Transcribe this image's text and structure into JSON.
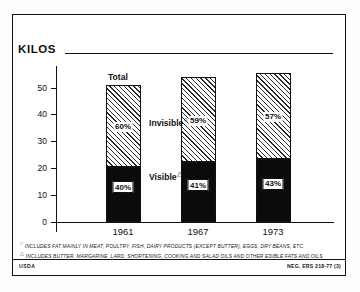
{
  "figure": {
    "unit_title": "KILOS",
    "agency": "USDA",
    "negative_number": "NEG. ERS 218-77 (3)",
    "footnotes": [
      {
        "marker": "○",
        "text": "INCLUDES FAT MAINLY IN MEAT, POULTRY, FISH, DAIRY PRODUCTS (EXCEPT BUTTER), EGGS, DRY BEANS, ETC."
      },
      {
        "marker": "△",
        "text": "INCLUDES BUTTER, MARGARINE, LARD, SHORTENING, COOKING AND SALAD OILS AND OTHER EDIBLE FATS AND OILS"
      }
    ],
    "annotations": {
      "total_label": "Total",
      "invisible_label": "Invisible",
      "invisible_marker": "○",
      "visible_label": "Visible",
      "visible_marker": "△"
    },
    "colors": {
      "visible_fill": "#0b0b0b",
      "invisible_fill": "#ffffff",
      "hatch": "#2a2a2a",
      "frame": "#111111",
      "background": "#ffffff"
    }
  },
  "chart_data": {
    "type": "bar",
    "title": "KILOS",
    "subtitle": "",
    "xlabel": "",
    "ylabel": "KILOS",
    "stacked": true,
    "grid": false,
    "legend_position": "in-plot",
    "categories": [
      "1961",
      "1967",
      "1973"
    ],
    "yticks": [
      0,
      10,
      20,
      30,
      40,
      50
    ],
    "ylim": [
      0,
      58
    ],
    "series": [
      {
        "name": "Visible",
        "footnote_marker": "△",
        "values": [
          20.6,
          22.2,
          23.4
        ],
        "labels": [
          "40%",
          "41%",
          "43%"
        ],
        "fill": "solid-black"
      },
      {
        "name": "Invisible",
        "footnote_marker": "○",
        "values": [
          30.4,
          31.6,
          32.1
        ],
        "labels": [
          "60%",
          "59%",
          "57%"
        ],
        "fill": "diagonal-hatch"
      }
    ],
    "totals": [
      51.0,
      53.8,
      55.5
    ],
    "total_label": "Total"
  }
}
